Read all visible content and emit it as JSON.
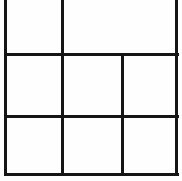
{
  "document": {
    "kind": "table-grid",
    "title": "Empty table grid",
    "background_color": "#fefefe",
    "ink_color": "#151515",
    "canvas": {
      "width": 182,
      "height": 181
    },
    "notes": "Blank ruled table outline; top edge of frame is cropped outside the image. No text content is present in any cell."
  },
  "grid": {
    "stroke_width_px": 3,
    "frame": {
      "left_x": 5,
      "right_x": 176,
      "top_y": -2,
      "bottom_y": 174,
      "top_edge_visible": false
    },
    "rows": [
      {
        "name": "row-top",
        "top_y": -2,
        "bottom_y": 54,
        "cell_count": 2
      },
      {
        "name": "row-middle",
        "top_y": 54,
        "bottom_y": 116,
        "cell_count": 3
      },
      {
        "name": "row-bottom",
        "top_y": 116,
        "bottom_y": 174,
        "cell_count": 3
      }
    ],
    "horizontal_rules": [
      {
        "name": "rule-1",
        "y": 54,
        "x_start": 5,
        "x_end": 176
      },
      {
        "name": "rule-2",
        "y": 116,
        "x_start": 5,
        "x_end": 176
      },
      {
        "name": "rule-bottom",
        "y": 174,
        "x_start": 5,
        "x_end": 176
      }
    ],
    "vertical_rules": [
      {
        "name": "rule-left-frame",
        "x": 5,
        "y_start": -2,
        "y_end": 176
      },
      {
        "name": "rule-col-1",
        "x": 62,
        "y_start": -2,
        "y_end": 176
      },
      {
        "name": "rule-col-2",
        "x": 122,
        "y_start": 54,
        "y_end": 176
      },
      {
        "name": "rule-right-frame",
        "x": 176,
        "y_start": -2,
        "y_end": 176
      }
    ],
    "cells": [
      {
        "name": "cell-r1-c1",
        "row": 1,
        "col": 1,
        "x": 5,
        "y": -2,
        "w": 57,
        "h": 56,
        "text": ""
      },
      {
        "name": "cell-r1-c2",
        "row": 1,
        "col": 2,
        "x": 62,
        "y": -2,
        "w": 114,
        "h": 56,
        "text": ""
      },
      {
        "name": "cell-r2-c1",
        "row": 2,
        "col": 1,
        "x": 5,
        "y": 54,
        "w": 57,
        "h": 62,
        "text": ""
      },
      {
        "name": "cell-r2-c2",
        "row": 2,
        "col": 2,
        "x": 62,
        "y": 54,
        "w": 60,
        "h": 62,
        "text": ""
      },
      {
        "name": "cell-r2-c3",
        "row": 2,
        "col": 3,
        "x": 122,
        "y": 54,
        "w": 54,
        "h": 62,
        "text": ""
      },
      {
        "name": "cell-r3-c1",
        "row": 3,
        "col": 1,
        "x": 5,
        "y": 116,
        "w": 57,
        "h": 58,
        "text": ""
      },
      {
        "name": "cell-r3-c2",
        "row": 3,
        "col": 2,
        "x": 62,
        "y": 116,
        "w": 60,
        "h": 58,
        "text": ""
      },
      {
        "name": "cell-r3-c3",
        "row": 3,
        "col": 3,
        "x": 122,
        "y": 116,
        "w": 54,
        "h": 58,
        "text": ""
      }
    ]
  }
}
